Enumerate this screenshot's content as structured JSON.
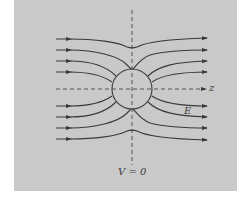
{
  "figure": {
    "background_color": "#c9c9c9",
    "line_color": "#3a3a3a",
    "labels": {
      "z_axis": "z",
      "field": "E",
      "equipotential": "V = 0"
    },
    "sphere": {
      "cx": 132,
      "cy": 89,
      "r": 20
    },
    "field_lines": {
      "count": 8,
      "left_y": [
        39,
        50,
        61,
        72,
        106,
        117,
        128,
        139
      ],
      "direction": "left-to-right"
    }
  }
}
